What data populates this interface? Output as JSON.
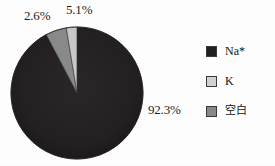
{
  "chart_data": {
    "type": "pie",
    "title": "",
    "subtitle": "",
    "xlabel": "",
    "ylabel": "",
    "legend_position": "right",
    "grid": false,
    "start_angle_deg": 0,
    "direction": "clockwise",
    "categories": [
      "Na*",
      "K",
      "空白"
    ],
    "values": [
      92.3,
      2.6,
      5.1
    ],
    "value_unit": "%",
    "data_labels": [
      "92.3%",
      "2.6%",
      "5.1%"
    ],
    "colors": [
      "#231f20",
      "#c9c9c9",
      "#8a8a8a"
    ],
    "slices": [
      {
        "label": "Na*",
        "value": 92.3,
        "display": "92.3%",
        "color": "#231f20",
        "label_position": "outside-right"
      },
      {
        "label": "K",
        "value": 2.6,
        "display": "2.6%",
        "color": "#c9c9c9",
        "label_position": "outside-top-left"
      },
      {
        "label": "空白",
        "value": 5.1,
        "display": "5.1%",
        "color": "#8a8a8a",
        "label_position": "outside-top"
      }
    ]
  },
  "labels": {
    "pct_k": "2.6%",
    "pct_blank": "5.1%",
    "pct_na": "92.3%"
  },
  "legend": {
    "items": [
      {
        "label": "Na*",
        "color": "#231f20"
      },
      {
        "label": "K",
        "color": "#d2d2d2"
      },
      {
        "label": "空白",
        "color": "#8a8a8a"
      }
    ]
  },
  "colors": {
    "background": "#ffffff",
    "text": "#1d1d1d",
    "outline": "#3a3a3a",
    "na_slice": "#231f20",
    "k_slice": "#c9c9c9",
    "blank_slice": "#8a8a8a"
  }
}
